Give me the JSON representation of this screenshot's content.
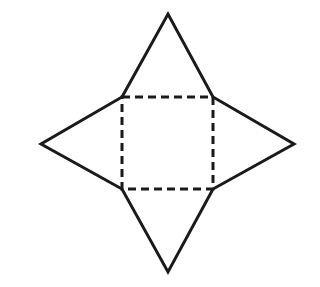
{
  "diagram": {
    "stroke_color": "#1a1a1a",
    "background": "#ffffff",
    "base_square": {
      "corners": [
        [
          122,
          97
        ],
        [
          213,
          97
        ],
        [
          213,
          189
        ],
        [
          122,
          189
        ]
      ],
      "style": "dashed"
    },
    "triangles": [
      {
        "name": "top",
        "apex": [
          168,
          14
        ],
        "base": [
          [
            122,
            97
          ],
          [
            213,
            97
          ]
        ]
      },
      {
        "name": "right",
        "apex": [
          294,
          144
        ],
        "base": [
          [
            213,
            97
          ],
          [
            213,
            189
          ]
        ]
      },
      {
        "name": "bottom",
        "apex": [
          168,
          272
        ],
        "base": [
          [
            122,
            189
          ],
          [
            213,
            189
          ]
        ]
      },
      {
        "name": "left",
        "apex": [
          41,
          144
        ],
        "base": [
          [
            122,
            97
          ],
          [
            122,
            189
          ]
        ]
      }
    ]
  }
}
